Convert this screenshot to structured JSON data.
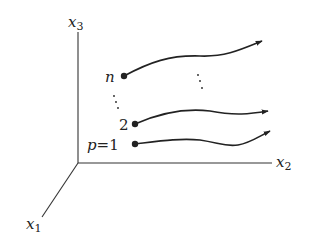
{
  "diagram": {
    "type": "coordinate-trajectories",
    "axes": {
      "x1": {
        "label": "x",
        "subscript": "1"
      },
      "x2": {
        "label": "x",
        "subscript": "2"
      },
      "x3": {
        "label": "x",
        "subscript": "3"
      }
    },
    "particles": [
      {
        "id": "p1",
        "label_var": "p",
        "label_eq": "=",
        "label_num": "1"
      },
      {
        "id": "p2",
        "label_num": "2"
      },
      {
        "id": "pn",
        "label_var": "n"
      }
    ],
    "colors": {
      "line": "#222222",
      "axis": "#333333",
      "background": "#ffffff"
    }
  }
}
